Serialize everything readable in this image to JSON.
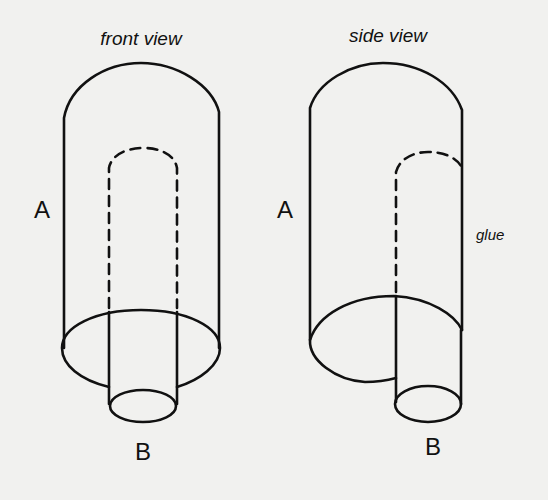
{
  "diagram": {
    "panels": [
      {
        "title": "front view",
        "outer_label": "A",
        "inner_label": "B"
      },
      {
        "title": "side view",
        "outer_label": "A",
        "inner_label": "B",
        "annotation": "glue"
      }
    ],
    "colors": {
      "background": "#f1f1ef",
      "stroke": "#111111"
    }
  }
}
